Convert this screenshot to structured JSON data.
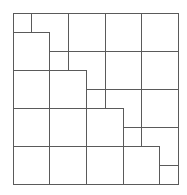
{
  "diagram": {
    "background": "#ffffff",
    "stroke_color": "#5a5a5a",
    "horizontal_lines": [
      {
        "y": 13,
        "x1": 13,
        "x2": 178
      },
      {
        "y": 32,
        "x1": 13,
        "x2": 49
      },
      {
        "y": 51,
        "x1": 49,
        "x2": 178
      },
      {
        "y": 70,
        "x1": 13,
        "x2": 86
      },
      {
        "y": 89,
        "x1": 86,
        "x2": 178
      },
      {
        "y": 108,
        "x1": 13,
        "x2": 123
      },
      {
        "y": 127,
        "x1": 123,
        "x2": 178
      },
      {
        "y": 146,
        "x1": 13,
        "x2": 159
      },
      {
        "y": 165,
        "x1": 159,
        "x2": 178
      },
      {
        "y": 184,
        "x1": 13,
        "x2": 178
      }
    ],
    "vertical_lines": [
      {
        "x": 13,
        "y1": 13,
        "y2": 184
      },
      {
        "x": 31,
        "y1": 13,
        "y2": 32
      },
      {
        "x": 49,
        "y1": 32,
        "y2": 184
      },
      {
        "x": 68,
        "y1": 13,
        "y2": 70
      },
      {
        "x": 86,
        "y1": 70,
        "y2": 184
      },
      {
        "x": 105,
        "y1": 13,
        "y2": 108
      },
      {
        "x": 123,
        "y1": 108,
        "y2": 184
      },
      {
        "x": 141,
        "y1": 13,
        "y2": 146
      },
      {
        "x": 159,
        "y1": 146,
        "y2": 184
      },
      {
        "x": 178,
        "y1": 13,
        "y2": 184
      }
    ]
  }
}
